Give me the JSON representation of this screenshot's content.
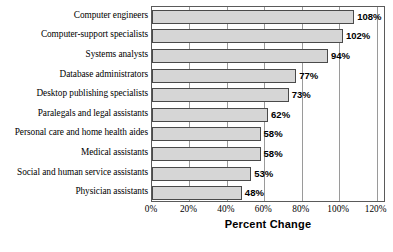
{
  "chart_data": {
    "type": "bar",
    "orientation": "horizontal",
    "title": "",
    "xlabel": "Percent Change",
    "ylabel": "",
    "xlim": [
      0,
      125
    ],
    "xticks": [
      0,
      20,
      40,
      60,
      80,
      100,
      120
    ],
    "xtick_labels": [
      "0%",
      "20%",
      "40%",
      "60%",
      "80%",
      "100%",
      "120%"
    ],
    "grid": true,
    "grid_axis": "x",
    "legend": false,
    "categories": [
      "Computer engineers",
      "Computer-support specialists",
      "Systems analysts",
      "Database administrators",
      "Desktop publishing specialists",
      "Paralegals and legal assistants",
      "Personal care and home health aides",
      "Medical assistants",
      "Social and human service assistants",
      "Physician assistants"
    ],
    "values": [
      108,
      102,
      94,
      77,
      73,
      62,
      58,
      58,
      53,
      48
    ],
    "value_labels": [
      "108%",
      "102%",
      "94%",
      "77%",
      "73%",
      "62%",
      "58%",
      "58%",
      "53%",
      "48%"
    ],
    "bar_color": "#d6d6d6",
    "bar_edge_color": "#4a4a4a",
    "grid_color": "#9a9a9a",
    "frame_color": "#5a5a5a"
  }
}
